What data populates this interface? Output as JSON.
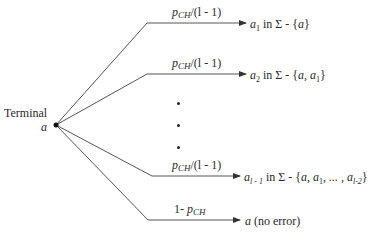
{
  "diagram": {
    "root": {
      "label": "Terminal",
      "symbol": "a"
    },
    "branches": [
      {
        "id": "b1",
        "prob": {
          "p": "p",
          "sub": "CH",
          "rest": "/(l - 1)"
        },
        "outcome": {
          "sym": "a",
          "sub": "1",
          "text": " in Σ - {",
          "set": "a",
          "close": "}"
        }
      },
      {
        "id": "b2",
        "prob": {
          "p": "p",
          "sub": "CH",
          "rest": "/(l - 1)"
        },
        "outcome": {
          "sym": "a",
          "sub": "2",
          "text": " in Σ - {",
          "set": "a, a",
          "set_sub": "1",
          "close": "}"
        }
      },
      {
        "id": "b3",
        "prob": {
          "p": "p",
          "sub": "CH",
          "rest": "/(l - 1)"
        },
        "outcome": {
          "sym": "a",
          "sub": "l - 1",
          "text": " in Σ - {",
          "set": "a, a",
          "set_sub": "1",
          "mid": ", ... , a",
          "end_sub": "l-2",
          "close": "}"
        }
      },
      {
        "id": "b4",
        "prob": {
          "pre": "1- ",
          "p": "p",
          "sub": "CH"
        },
        "outcome": {
          "sym": "a",
          "text": " (no error)"
        }
      }
    ],
    "ellipsis": "vertical dots",
    "colors": {
      "line": "#555555",
      "text": "#2a2a2a"
    }
  }
}
